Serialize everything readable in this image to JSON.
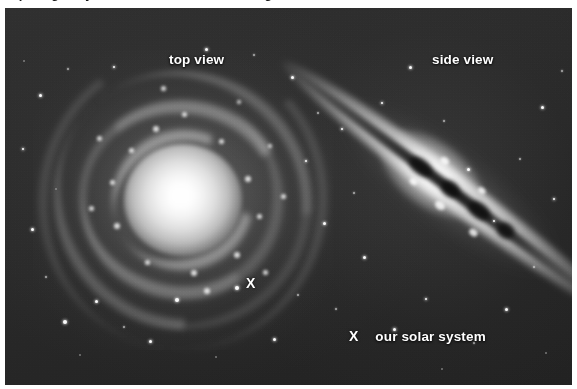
{
  "figure": {
    "alt_description": "Two photographs of spiral galaxies illustrating the Milky Way: one seen face-on (top view) and one seen edge-on (side view), each with an X marking the location of our solar system.",
    "background_color": "#262626",
    "label_color": "#ffffff",
    "clipped_caption_above": "a spiral galaxy seen from two different angles",
    "labels": {
      "top_view": "top view",
      "side_view": "side view",
      "solar_system": "our solar system",
      "marker_glyph": "X"
    },
    "markers": [
      {
        "name": "solar-system-marker-top-view",
        "glyph": "X",
        "x": 250,
        "y": 283,
        "view": "top view"
      },
      {
        "name": "solar-system-marker-side-view",
        "glyph": "X",
        "x": 353,
        "y": 337,
        "view": "side view"
      }
    ],
    "panels": [
      {
        "id": "top-view",
        "label": "top view",
        "galaxy_orientation": "face-on spiral",
        "label_x": 196,
        "label_y": 60
      },
      {
        "id": "side-view",
        "label": "side view",
        "galaxy_orientation": "edge-on spiral with dust lane",
        "label_x": 459,
        "label_y": 60
      }
    ]
  }
}
